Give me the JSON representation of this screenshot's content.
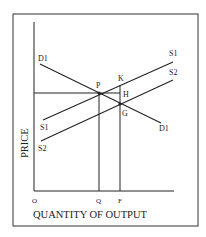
{
  "diagram": {
    "type": "supply-demand",
    "axes": {
      "y_label": "PRICE",
      "x_label": "QUANTITY OF OUTPUT",
      "origin_label": "O"
    },
    "curves": {
      "demand": {
        "label_start": "D1",
        "label_end": "D1"
      },
      "supply1": {
        "label_start": "S1",
        "label_end": "S1"
      },
      "supply2": {
        "label_start": "S2",
        "label_end": "S2"
      }
    },
    "points": {
      "P": "P",
      "K": "K",
      "H": "H",
      "G": "G"
    },
    "x_ticks": {
      "Q": "Q",
      "F": "F"
    },
    "colors": {
      "line": "#222222",
      "border": "#333333",
      "background": "#ffffff"
    }
  }
}
